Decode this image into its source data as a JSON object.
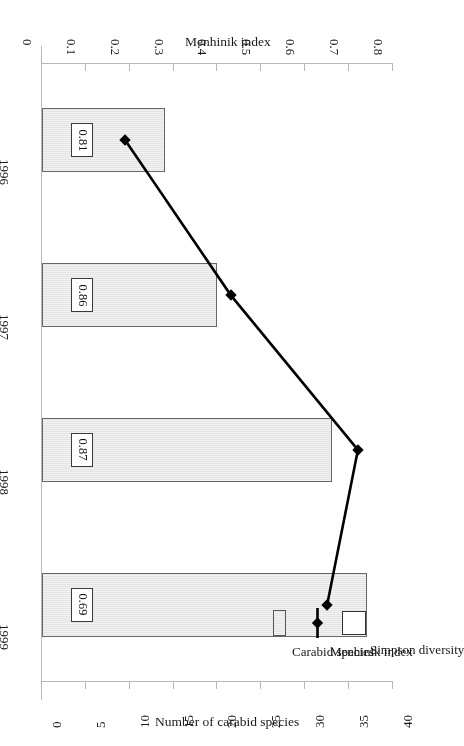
{
  "chart_data": {
    "type": "bar",
    "title": "",
    "categories": [
      "1996",
      "1997",
      "1998",
      "1999"
    ],
    "series": [
      {
        "name": "Carabid species",
        "type": "bar",
        "axis": "bottom",
        "values": [
          14,
          20,
          33,
          37
        ]
      },
      {
        "name": "Menhinik index",
        "type": "line",
        "axis": "top",
        "values": [
          0.19,
          0.43,
          0.72,
          0.65
        ]
      },
      {
        "name": "Simpson diversity",
        "type": "label",
        "values": [
          0.81,
          0.86,
          0.87,
          0.69
        ],
        "value_labels": [
          "0.81",
          "0.86",
          "0.87",
          "0.69"
        ]
      }
    ],
    "axes": {
      "bottom": {
        "label": "Number of carabid species",
        "ticks": [
          "0",
          "5",
          "10",
          "15",
          "20",
          "25",
          "30",
          "35",
          "40"
        ],
        "tick_values": [
          0,
          5,
          10,
          15,
          20,
          25,
          30,
          35,
          40
        ],
        "min": 0,
        "max": 40
      },
      "top": {
        "label": "Menhinik index",
        "ticks": [
          "0",
          "0.1",
          "0.2",
          "0.3",
          "0.4",
          "0.5",
          "0.6",
          "0.7",
          "0.8"
        ],
        "tick_values": [
          0,
          0.1,
          0.2,
          0.3,
          0.4,
          0.5,
          0.6,
          0.7,
          0.8
        ],
        "min": 0,
        "max": 0.8
      },
      "category": {
        "label": "",
        "ticks": [
          "1996",
          "1997",
          "1998",
          "1999"
        ]
      }
    },
    "legend": {
      "position": "bottom-left",
      "entries": [
        {
          "label": "Carabid species",
          "marker": "bar-swatch"
        },
        {
          "label": "Menhinik index",
          "marker": "line-diamond"
        },
        {
          "label": "Simpson diversity",
          "marker": "open-box"
        }
      ]
    },
    "grid": false,
    "orientation": "page-rotated-180"
  },
  "colors": {
    "bar_fill": "#eeeeee",
    "bar_stroke": "#666666",
    "line": "#000000",
    "axis": "#b8b8b8",
    "text": "#1a1a1a",
    "label_box_fill": "#ffffff",
    "label_box_stroke": "#3a3a3a"
  }
}
